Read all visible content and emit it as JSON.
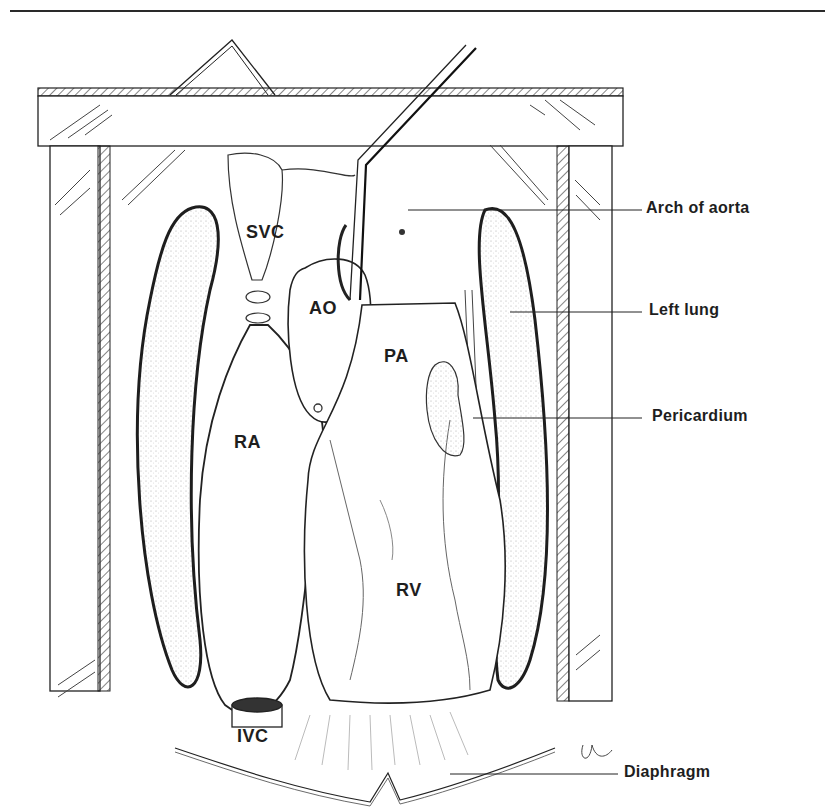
{
  "figure": {
    "type": "anatomical illustration",
    "structure_labels": {
      "svc": "SVC",
      "ao": "AO",
      "pa": "PA",
      "ra": "RA",
      "rv": "RV",
      "ivc": "IVC"
    },
    "callouts": [
      {
        "id": "arch-of-aorta",
        "label": "Arch of aorta"
      },
      {
        "id": "left-lung",
        "label": "Left lung"
      },
      {
        "id": "pericardium",
        "label": "Pericardium"
      },
      {
        "id": "diaphragm",
        "label": "Diaphragm"
      }
    ],
    "colors": {
      "ink": "#1e1e1e",
      "paper": "#ffffff",
      "hatch": "#555555"
    }
  }
}
